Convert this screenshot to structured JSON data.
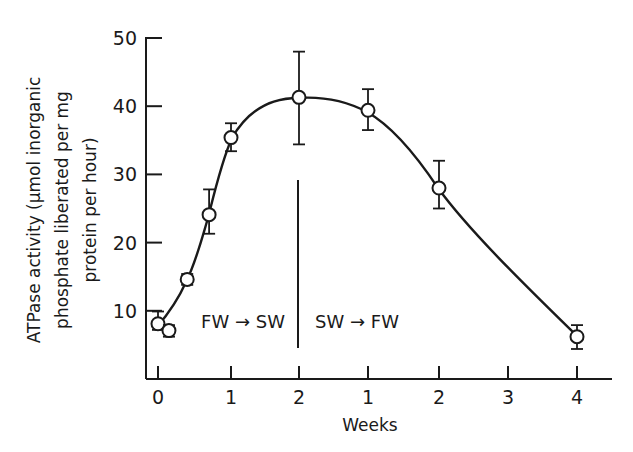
{
  "chart_data": {
    "type": "line",
    "title": "",
    "xlabel": "Weeks",
    "ylabel": "ATPase activity (μmol inorganic phosphate liberated per mg protein per hour)",
    "ylabel_lines": [
      "ATPase activity (μmol inorganic",
      "phosphate liberated per mg",
      "protein per hour)"
    ],
    "ylim": [
      0,
      50
    ],
    "yticks": [
      10,
      20,
      30,
      40,
      50
    ],
    "xtick_labels": [
      "0",
      "1",
      "2",
      "1",
      "2",
      "3",
      "4"
    ],
    "grid": false,
    "legend": null,
    "annotations": [
      {
        "text": "FW → SW",
        "region": "weeks 0–2 after transfer from fresh water to sea water"
      },
      {
        "text": "SW → FW",
        "region": "weeks after transfer back from sea water to fresh water"
      }
    ],
    "divider_at": "week 2 (FW→SW) / week 0 (SW→FW)",
    "series": [
      {
        "name": "ATPase activity",
        "marker": "open circle",
        "points": [
          {
            "phase": "FW->SW",
            "week": 0.0,
            "x_index": 0.0,
            "y": 8.1,
            "err_low": 7.2,
            "err_high": 9.9
          },
          {
            "phase": "FW->SW",
            "week": 0.15,
            "x_index": 0.15,
            "y": 7.1,
            "err_low": 6.2,
            "err_high": 7.9
          },
          {
            "phase": "FW->SW",
            "week": 0.4,
            "x_index": 0.4,
            "y": 14.6,
            "err_low": 13.8,
            "err_high": 15.4
          },
          {
            "phase": "FW->SW",
            "week": 0.7,
            "x_index": 0.7,
            "y": 24.1,
            "err_low": 21.3,
            "err_high": 27.8
          },
          {
            "phase": "FW->SW",
            "week": 1.0,
            "x_index": 1.0,
            "y": 35.4,
            "err_low": 33.4,
            "err_high": 37.5
          },
          {
            "phase": "FW->SW",
            "week": 2.0,
            "x_index": 2.0,
            "y": 41.3,
            "err_low": 34.4,
            "err_high": 48.0
          },
          {
            "phase": "SW->FW",
            "week": 1.0,
            "x_index": 3.0,
            "y": 39.4,
            "err_low": 36.5,
            "err_high": 42.5
          },
          {
            "phase": "SW->FW",
            "week": 2.0,
            "x_index": 4.0,
            "y": 28.0,
            "err_low": 25.0,
            "err_high": 32.0
          },
          {
            "phase": "SW->FW",
            "week": 4.0,
            "x_index": 6.0,
            "y": 6.2,
            "err_low": 4.4,
            "err_high": 7.9
          }
        ]
      }
    ]
  }
}
